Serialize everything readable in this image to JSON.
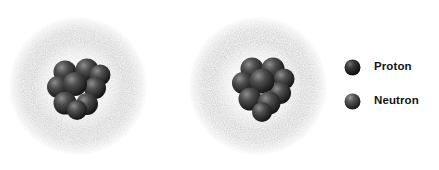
{
  "figure": {
    "background_color": "#ffffff"
  },
  "atoms": [
    {
      "name": "atom-left",
      "electron_cloud": {
        "icon": "electron-cloud-icon",
        "description": "stippled spherical electron cloud",
        "center": [
          78,
          86
        ],
        "radius": 68,
        "color": "#8a8a8a"
      },
      "nucleus": {
        "icon": "nucleus-icon",
        "description": "cluster of proton and neutron spheres",
        "center": [
          79,
          84
        ],
        "radius": 26
      }
    },
    {
      "name": "atom-right",
      "electron_cloud": {
        "icon": "electron-cloud-icon",
        "description": "stippled spherical electron cloud",
        "center": [
          258,
          86
        ],
        "radius": 68,
        "color": "#8a8a8a"
      },
      "nucleus": {
        "icon": "nucleus-icon",
        "description": "cluster of proton and neutron spheres",
        "center": [
          264,
          86
        ],
        "radius": 28
      }
    }
  ],
  "legend": {
    "items": [
      {
        "label": "Proton",
        "icon": "proton-sphere-icon",
        "color": "#1d1d1d",
        "highlight_color": "#6f6f6f"
      },
      {
        "label": "Neutron",
        "icon": "neutron-sphere-icon",
        "color": "#3b3b3b",
        "highlight_color": "#9a9a9a"
      }
    ]
  }
}
